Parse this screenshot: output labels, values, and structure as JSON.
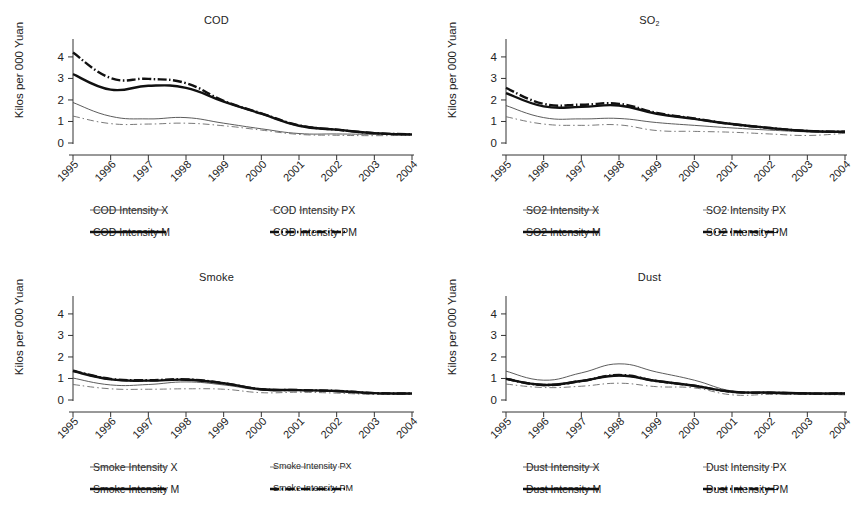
{
  "figure": {
    "ylabel": "Kilos per 000 Yuan",
    "yticks": [
      "0",
      "1",
      "2",
      "3",
      "4"
    ],
    "xticks": [
      "1995",
      "1996",
      "1997",
      "1998",
      "1999",
      "2000",
      "2001",
      "2002",
      "2003",
      "2004"
    ]
  },
  "chart_data": [
    {
      "type": "line",
      "title": "COD",
      "panel": "top-left",
      "xlabel": "",
      "ylabel": "Kilos per 000 Yuan",
      "x": [
        1995,
        1996,
        1997,
        1998,
        1999,
        2000,
        2001,
        2002,
        2003,
        2004
      ],
      "ylim": [
        0,
        4.6
      ],
      "xlim": [
        1995,
        2004
      ],
      "grid": false,
      "legend_position": "below",
      "series": [
        {
          "name": "COD Intensity X",
          "style": "thin-solid",
          "values": [
            1.88,
            1.24,
            1.12,
            1.18,
            0.92,
            0.66,
            0.44,
            0.42,
            0.4,
            0.38
          ]
        },
        {
          "name": "COD Intensity PX",
          "style": "thin-dashdot",
          "values": [
            1.25,
            0.9,
            0.88,
            0.92,
            0.8,
            0.6,
            0.4,
            0.36,
            0.34,
            0.36
          ]
        },
        {
          "name": "COD Intensity M",
          "style": "thick-solid",
          "values": [
            3.2,
            2.48,
            2.66,
            2.56,
            1.92,
            1.36,
            0.8,
            0.62,
            0.46,
            0.4
          ]
        },
        {
          "name": "COD Intensity PM",
          "style": "thick-dashdot",
          "values": [
            4.2,
            3.02,
            2.98,
            2.78,
            1.96,
            1.38,
            0.82,
            0.62,
            0.46,
            0.4
          ]
        }
      ]
    },
    {
      "type": "line",
      "title": "SO2",
      "title_display": "SO₂",
      "panel": "top-right",
      "xlabel": "",
      "ylabel": "Kilos per 000 Yuan",
      "x": [
        1995,
        1996,
        1997,
        1998,
        1999,
        2000,
        2001,
        2002,
        2003,
        2004
      ],
      "ylim": [
        0,
        4.6
      ],
      "xlim": [
        1995,
        2004
      ],
      "grid": false,
      "legend_position": "below",
      "series": [
        {
          "name": "SO2 Intensity X",
          "style": "thin-solid",
          "values": [
            1.74,
            1.18,
            1.12,
            1.14,
            0.95,
            0.82,
            0.7,
            0.6,
            0.52,
            0.5
          ]
        },
        {
          "name": "SO2 Intensity PX",
          "style": "thin-dashdot",
          "values": [
            1.22,
            0.88,
            0.82,
            0.84,
            0.58,
            0.54,
            0.5,
            0.42,
            0.35,
            0.45
          ]
        },
        {
          "name": "SO2 Intensity M",
          "style": "thick-solid",
          "values": [
            2.32,
            1.7,
            1.68,
            1.74,
            1.36,
            1.12,
            0.88,
            0.7,
            0.56,
            0.52
          ]
        },
        {
          "name": "SO2 Intensity PM",
          "style": "thick-dashdot",
          "values": [
            2.56,
            1.82,
            1.78,
            1.82,
            1.4,
            1.14,
            0.88,
            0.7,
            0.56,
            0.52
          ]
        }
      ]
    },
    {
      "type": "line",
      "title": "Smoke",
      "panel": "bottom-left",
      "xlabel": "",
      "ylabel": "Kilos per 000 Yuan",
      "x": [
        1995,
        1996,
        1997,
        1998,
        1999,
        2000,
        2001,
        2002,
        2003,
        2004
      ],
      "ylim": [
        0,
        4.6
      ],
      "xlim": [
        1995,
        2004
      ],
      "grid": false,
      "legend_position": "below",
      "series": [
        {
          "name": "Smoke Intensity X",
          "style": "thin-solid",
          "values": [
            1.02,
            0.7,
            0.72,
            0.84,
            0.7,
            0.46,
            0.44,
            0.4,
            0.32,
            0.3
          ]
        },
        {
          "name": "Smoke Intensity PX",
          "style": "thin-dashdot",
          "values": [
            0.72,
            0.52,
            0.5,
            0.52,
            0.5,
            0.34,
            0.36,
            0.32,
            0.26,
            0.28
          ]
        },
        {
          "name": "Smoke Intensity M",
          "style": "thick-solid",
          "values": [
            1.34,
            0.96,
            0.9,
            0.94,
            0.78,
            0.5,
            0.46,
            0.42,
            0.32,
            0.3
          ]
        },
        {
          "name": "Smoke Intensity PM",
          "style": "thick-dashdot",
          "values": [
            1.36,
            0.98,
            0.92,
            0.96,
            0.78,
            0.5,
            0.46,
            0.42,
            0.32,
            0.3
          ]
        }
      ]
    },
    {
      "type": "line",
      "title": "Dust",
      "panel": "bottom-right",
      "xlabel": "",
      "ylabel": "Kilos per 000 Yuan",
      "x": [
        1995,
        1996,
        1997,
        1998,
        1999,
        2000,
        2001,
        2002,
        2003,
        2004
      ],
      "ylim": [
        0,
        4.6
      ],
      "xlim": [
        1995,
        2004
      ],
      "grid": false,
      "legend_position": "below",
      "series": [
        {
          "name": "Dust Intensity X",
          "style": "thin-solid",
          "values": [
            1.34,
            0.92,
            1.26,
            1.68,
            1.3,
            0.92,
            0.42,
            0.38,
            0.34,
            0.32
          ]
        },
        {
          "name": "Dust Intensity PX",
          "style": "thin-dashdot",
          "values": [
            0.74,
            0.58,
            0.64,
            0.78,
            0.62,
            0.56,
            0.24,
            0.26,
            0.26,
            0.24
          ]
        },
        {
          "name": "Dust Intensity M",
          "style": "thick-solid",
          "values": [
            0.98,
            0.7,
            0.88,
            1.14,
            0.88,
            0.66,
            0.38,
            0.34,
            0.3,
            0.3
          ]
        },
        {
          "name": "Dust Intensity PM",
          "style": "thick-dashdot",
          "values": [
            0.98,
            0.7,
            0.88,
            1.16,
            0.88,
            0.66,
            0.38,
            0.34,
            0.3,
            0.3
          ]
        }
      ]
    }
  ]
}
